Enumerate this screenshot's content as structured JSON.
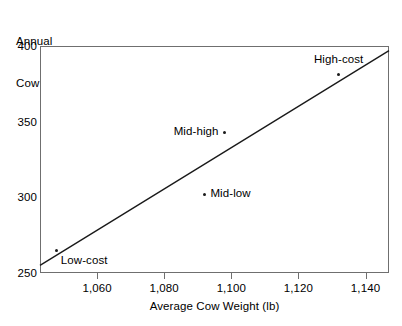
{
  "chart_data": {
    "type": "scatter",
    "title": "",
    "xlabel": "Average Cow Weight (lb)",
    "ylabel": "Annual\nCow Cost ($)",
    "ylabel_line1": "Annual",
    "ylabel_line2": "Cow Cost ($)",
    "xlim": [
      1043,
      1147
    ],
    "ylim": [
      250,
      400
    ],
    "xticks": [
      1060,
      1080,
      1100,
      1120,
      1140
    ],
    "xtick_labels": [
      "1,060",
      "1,080",
      "1,100",
      "1,120",
      "1,140"
    ],
    "yticks": [
      250,
      300,
      350,
      400
    ],
    "ytick_labels": [
      "250",
      "300",
      "350",
      "400"
    ],
    "grid": "horizontal",
    "legend": "none",
    "point_color": "#1a1a1a",
    "line_color": "#1a1a1a",
    "grid_color": "#e2e2e2",
    "frame_color": "#6f6f6f",
    "points": [
      {
        "label": "Low-cost",
        "x": 1048,
        "y": 265,
        "label_pos": "below-rt"
      },
      {
        "label": "Mid-low",
        "x": 1092,
        "y": 302,
        "label_pos": "right-of"
      },
      {
        "label": "Mid-high",
        "x": 1098,
        "y": 343,
        "label_pos": "left-of"
      },
      {
        "label": "High-cost",
        "x": 1132,
        "y": 381,
        "label_pos": "above-ctr"
      }
    ],
    "trendline": {
      "name": "fitted regression line",
      "x_start": 1043,
      "y_start": 255,
      "x_end": 1147,
      "y_end": 397
    }
  }
}
